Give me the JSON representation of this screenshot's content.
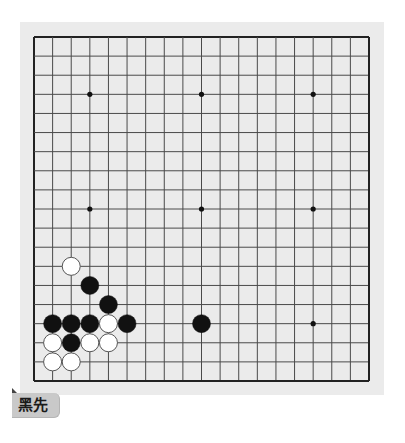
{
  "board": {
    "size": 19,
    "background_color": "#ebebeb",
    "line_color": "#4a4a4a",
    "border_color": "#222222",
    "grid": {
      "left": 34,
      "top": 37,
      "right": 369,
      "bottom": 381
    },
    "star_points": [
      [
        3,
        3
      ],
      [
        9,
        3
      ],
      [
        15,
        3
      ],
      [
        3,
        9
      ],
      [
        9,
        9
      ],
      [
        15,
        9
      ],
      [
        3,
        15
      ],
      [
        9,
        15
      ],
      [
        15,
        15
      ]
    ],
    "stones": [
      {
        "color": "white",
        "col": 2,
        "row": 12
      },
      {
        "color": "black",
        "col": 3,
        "row": 13
      },
      {
        "color": "black",
        "col": 4,
        "row": 14
      },
      {
        "color": "black",
        "col": 1,
        "row": 15
      },
      {
        "color": "black",
        "col": 2,
        "row": 15
      },
      {
        "color": "black",
        "col": 3,
        "row": 15
      },
      {
        "color": "white",
        "col": 4,
        "row": 15
      },
      {
        "color": "black",
        "col": 5,
        "row": 15
      },
      {
        "color": "black",
        "col": 9,
        "row": 15
      },
      {
        "color": "white",
        "col": 1,
        "row": 16
      },
      {
        "color": "black",
        "col": 2,
        "row": 16
      },
      {
        "color": "white",
        "col": 3,
        "row": 16
      },
      {
        "color": "white",
        "col": 4,
        "row": 16
      },
      {
        "color": "white",
        "col": 1,
        "row": 17
      },
      {
        "color": "white",
        "col": 2,
        "row": 17
      }
    ],
    "stone_colors": {
      "black": "#111111",
      "white": "#ffffff",
      "white_outline": "#555555"
    }
  },
  "turn_label": {
    "text": "黑先"
  }
}
